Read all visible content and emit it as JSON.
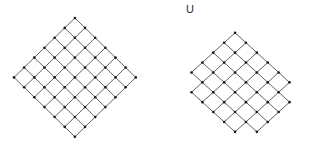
{
  "figure": {
    "background_color": "#ffffff",
    "width": 309,
    "height": 151,
    "line_color": "#3a3a3a",
    "vertex_color": "#1a1a1a",
    "line_width": 0.8,
    "vertex_radius": 1.3
  },
  "panels": [
    {
      "id": "left-lattice",
      "label": "",
      "has_label": false,
      "type": "diamond-lattice",
      "origin_x": 14,
      "origin_y": 18,
      "width": 122,
      "height": 119,
      "columns": 6,
      "rows": 6,
      "cell_width": 20.3,
      "cell_height": 19.8
    },
    {
      "id": "right-lattice",
      "label": "U",
      "has_label": true,
      "label_x": 186,
      "label_y": 4,
      "type": "diamond-lattice",
      "origin_x": 186,
      "origin_y": 18,
      "width": 109,
      "height": 119,
      "columns": 5,
      "rows": 6,
      "cell_width": 21.8,
      "cell_height": 19.8
    }
  ],
  "chart_data": {
    "type": "diagram",
    "title": "",
    "series": [
      {
        "name": "left-lattice",
        "label": "",
        "columns": 6,
        "rows": 6,
        "edge_orientation": "diagonal",
        "vertex_marker": "dot"
      },
      {
        "name": "right-lattice",
        "label": "U",
        "columns": 5,
        "rows": 6,
        "edge_orientation": "diagonal",
        "vertex_marker": "dot"
      }
    ],
    "legend_position": "none",
    "grid": false,
    "xlabel": "",
    "ylabel": ""
  }
}
